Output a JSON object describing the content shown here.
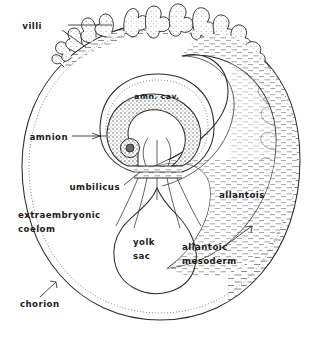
{
  "figure": {
    "type": "anatomical-schematic",
    "width": 330,
    "height": 340,
    "background_color": "#ffffff",
    "ink_color": "#2b2b2b",
    "hatch_color": "#8c8c8c"
  },
  "labels": {
    "villi": "villi",
    "amnion": "amnion",
    "amniotic_cavity": "amn. cav.",
    "umbilicus": "umbilicus",
    "extraembryonic_coelom_line1": "extraembryonic",
    "extraembryonic_coelom_line2": "coelom",
    "chorion": "chorion",
    "yolk_sac_line1": "yolk",
    "yolk_sac_line2": "sac",
    "allantois": "allantois",
    "allantoic_mesoderm_line1": "allantoic",
    "allantoic_mesoderm_line2": "mesoderm"
  },
  "structures": [
    {
      "name": "chorion",
      "description": "outer double-walled oval boundary enclosing the whole conceptus"
    },
    {
      "name": "villi",
      "description": "branching finger-like chorionic villi along the upper and right margin"
    },
    {
      "name": "extraembryonic-coelom",
      "description": "large clear cavity between chorion and inner membranes"
    },
    {
      "name": "amnion",
      "description": "stippled membrane enclosing the amniotic cavity around the embryo"
    },
    {
      "name": "amniotic-cavity",
      "description": "space within the amnion surrounding the embryo"
    },
    {
      "name": "embryo",
      "description": "shaded C-shaped embryo with head fold at left"
    },
    {
      "name": "umbilicus",
      "description": "constricted body stalk beneath the embryo"
    },
    {
      "name": "yolk-sac",
      "description": "pear-shaped sac suspended below the umbilicus"
    },
    {
      "name": "allantois",
      "description": "large spiral cavity right of the embryo extending to the chorion"
    },
    {
      "name": "allantoic-mesoderm",
      "description": "hatched mesodermal layer lining the allantois against the chorion"
    }
  ]
}
